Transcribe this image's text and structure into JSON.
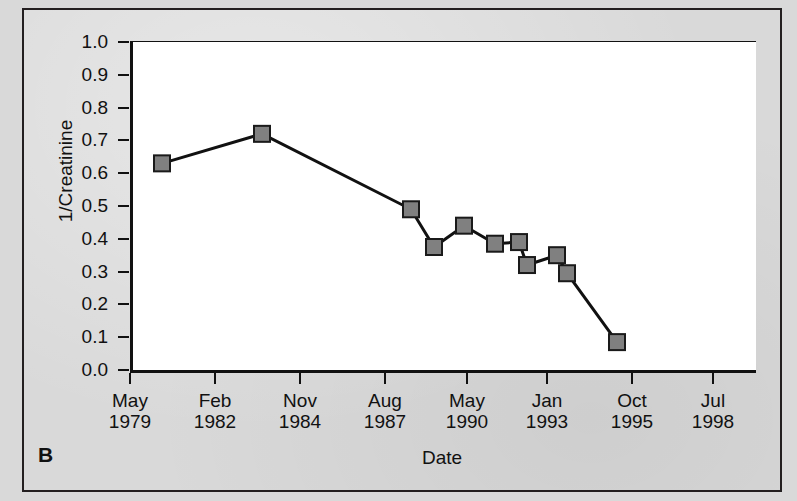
{
  "figure": {
    "panel_letter": "B",
    "background_color": "#d9d9d9",
    "plot_background_color": "#ffffff",
    "frame_color": "#231f20"
  },
  "chart_data": {
    "type": "line",
    "title": "",
    "xlabel": "Date",
    "ylabel": "1/Creatinine",
    "ylim": [
      0.0,
      1.0
    ],
    "grid": false,
    "legend": null,
    "marker": {
      "shape": "square",
      "fill_color": "#808080",
      "edge_color": "#1a1a1a"
    },
    "line_color": "#111111",
    "y_ticks": [
      "1.0",
      "0.9",
      "0.8",
      "0.7",
      "0.6",
      "0.5",
      "0.4",
      "0.3",
      "0.2",
      "0.1",
      "0.0"
    ],
    "y_tick_values": [
      1.0,
      0.9,
      0.8,
      0.7,
      0.6,
      0.5,
      0.4,
      0.3,
      0.2,
      0.1,
      0.0
    ],
    "x_ticks": [
      {
        "month": "May",
        "year": "1979"
      },
      {
        "month": "Feb",
        "year": "1982"
      },
      {
        "month": "Nov",
        "year": "1984"
      },
      {
        "month": "Aug",
        "year": "1987"
      },
      {
        "month": "May",
        "year": "1990"
      },
      {
        "month": "Jan",
        "year": "1993"
      },
      {
        "month": "Oct",
        "year": "1995"
      },
      {
        "month": "Jul",
        "year": "1998"
      }
    ],
    "x_tick_positions_px": [
      130,
      215,
      300,
      385,
      467,
      547,
      632,
      713
    ],
    "points": [
      {
        "x_px": 162,
        "value": 0.63,
        "date": "Jan 1980"
      },
      {
        "x_px": 262,
        "value": 0.72,
        "date": "Jun 1983"
      },
      {
        "x_px": 411,
        "value": 0.49,
        "date": "Jul 1988"
      },
      {
        "x_px": 434,
        "value": 0.375,
        "date": "Jun 1989"
      },
      {
        "x_px": 464,
        "value": 0.44,
        "date": "Apr 1990"
      },
      {
        "x_px": 495,
        "value": 0.385,
        "date": "Apr 1991"
      },
      {
        "x_px": 519,
        "value": 0.39,
        "date": "Jan 1992"
      },
      {
        "x_px": 527,
        "value": 0.32,
        "date": "Jul 1992"
      },
      {
        "x_px": 557,
        "value": 0.35,
        "date": "Jul 1993"
      },
      {
        "x_px": 567,
        "value": 0.295,
        "date": "Jan 1994"
      },
      {
        "x_px": 617,
        "value": 0.085,
        "date": "Jul 1995"
      }
    ],
    "values": [
      0.63,
      0.72,
      0.49,
      0.375,
      0.44,
      0.385,
      0.39,
      0.32,
      0.35,
      0.295,
      0.085
    ]
  }
}
